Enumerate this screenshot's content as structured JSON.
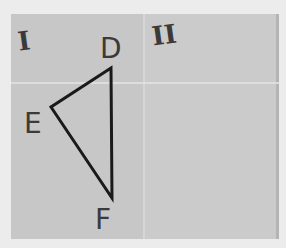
{
  "scene": {
    "description": "Photo of a folded sheet of paper with two halves labeled I and II; a triangle DEF drawn on half I",
    "colors": {
      "background": "#ececec",
      "paper": "#c9c9c9",
      "ink": "#1a1a1a",
      "labels": "#3a3a3a"
    }
  },
  "panels": [
    {
      "id": "I",
      "label": "I"
    },
    {
      "id": "II",
      "label": "II"
    }
  ],
  "triangle": {
    "vertices": [
      {
        "name": "D",
        "label": "D",
        "x": 111,
        "y": 68
      },
      {
        "name": "E",
        "label": "E",
        "x": 51,
        "y": 107
      },
      {
        "name": "F",
        "label": "F",
        "x": 112,
        "y": 198
      }
    ]
  }
}
